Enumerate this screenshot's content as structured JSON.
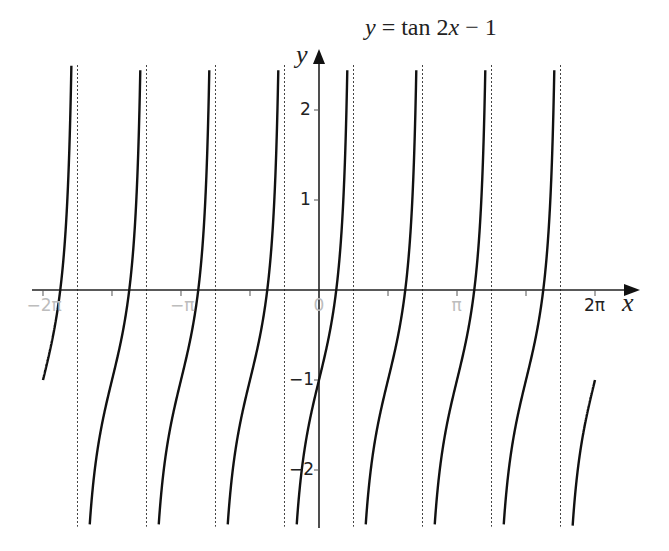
{
  "chart_data": {
    "type": "line",
    "title": "y = tan 2x − 1",
    "function": "tan(2x) - 1",
    "xlabel": "x",
    "ylabel": "y",
    "xlim": [
      -6.2832,
      6.2832
    ],
    "ylim": [
      -2.63,
      2.5
    ],
    "x_ticks": [
      {
        "value": -6.2832,
        "label": "−2π",
        "faint": true
      },
      {
        "value": -4.7124,
        "label": "",
        "faint": false
      },
      {
        "value": -3.1416,
        "label": "−π",
        "faint": true
      },
      {
        "value": -1.5708,
        "label": "",
        "faint": false
      },
      {
        "value": 0,
        "label": "0",
        "faint": true
      },
      {
        "value": 1.5708,
        "label": "",
        "faint": false
      },
      {
        "value": 3.1416,
        "label": "π",
        "faint": true
      },
      {
        "value": 4.7124,
        "label": "",
        "faint": false
      },
      {
        "value": 6.2832,
        "label": "2π",
        "faint": false
      }
    ],
    "y_ticks": [
      {
        "value": 2,
        "label": "2"
      },
      {
        "value": 1,
        "label": "1"
      },
      {
        "value": -1,
        "label": "−1"
      },
      {
        "value": -2,
        "label": "−2"
      }
    ],
    "asymptotes": [
      "-7π/4",
      "-5π/4",
      "-3π/4",
      "-π/4",
      "π/4",
      "3π/4",
      "5π/4",
      "7π/4"
    ],
    "asymptote_values": [
      -5.4978,
      -3.927,
      -2.3562,
      -0.7854,
      0.7854,
      2.3562,
      3.927,
      5.4978
    ],
    "y_intercept": -1,
    "x_intercepts_approx": [
      -5.8905,
      -4.3197,
      -2.7489,
      -1.1781,
      0.3927,
      1.9635,
      3.5343,
      5.1051
    ],
    "sample_points": [
      {
        "x": -6.2832,
        "y": -1
      },
      {
        "x": 0,
        "y": -1
      },
      {
        "x": 0.3927,
        "y": 0
      },
      {
        "x": -0.3927,
        "y": -2
      },
      {
        "x": 6.2832,
        "y": -1
      }
    ],
    "grid": false,
    "legend": "none"
  },
  "labels": {
    "title_lhs": "y",
    "title_rhs": " = tan 2",
    "title_var": "x",
    "title_tail": " − 1",
    "x_axis": "x",
    "y_axis": "y"
  }
}
